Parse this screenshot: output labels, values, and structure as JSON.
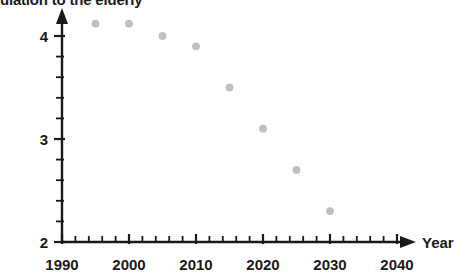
{
  "chart_data": {
    "type": "scatter",
    "title": "ulation to the elderly",
    "title_clipped": true,
    "xlabel": "Year",
    "ylabel": "",
    "x": [
      1995,
      2000,
      2005,
      2010,
      2015,
      2020,
      2025,
      2030
    ],
    "values": [
      4.12,
      4.12,
      4.0,
      3.9,
      3.5,
      3.1,
      2.7,
      2.3
    ],
    "series": [
      {
        "name": "ratio",
        "values": [
          4.12,
          4.12,
          4.0,
          3.9,
          3.5,
          3.1,
          2.7,
          2.3
        ]
      }
    ],
    "xlim": [
      1990,
      2044
    ],
    "ylim": [
      2,
      4.25
    ],
    "x_tick_labels": [
      "1990",
      "2000",
      "2010",
      "2020",
      "2030",
      "2040"
    ],
    "x_tick_values": [
      1990,
      2000,
      2010,
      2020,
      2030,
      2040
    ],
    "x_minor_step": 2,
    "y_tick_labels": [
      "2",
      "3",
      "4"
    ],
    "y_tick_values": [
      2,
      3,
      4
    ],
    "y_minor_step": 0.2,
    "grid": false,
    "legend": false,
    "marker_color": "#c0c0c0",
    "axis_color": "#1a1a1a",
    "arrow_x_axis": true,
    "arrow_y_axis": true
  }
}
